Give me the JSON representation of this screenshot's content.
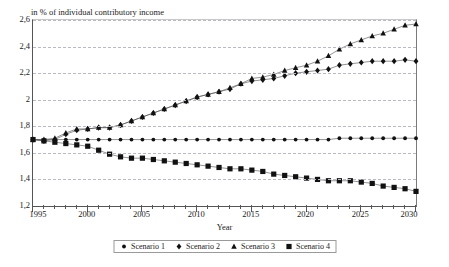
{
  "chart_data": {
    "type": "line",
    "title": "in % of individual contributory income",
    "xlabel": "Year",
    "ylabel": "",
    "xlim": [
      1995,
      2030
    ],
    "ylim": [
      1.2,
      2.6
    ],
    "ytick_step": 0.2,
    "xtick_step": 1,
    "xtick_label_step": 5,
    "grid": true,
    "decimal_separator": ",",
    "legend_position": "bottom",
    "ytick_labels": [
      "1,2",
      "1,4",
      "1,6",
      "1,8",
      "2",
      "2,2",
      "2,4",
      "2,6"
    ],
    "ytick_values": [
      1.2,
      1.4,
      1.6,
      1.8,
      2.0,
      2.2,
      2.4,
      2.6
    ],
    "xtick_labels": [
      "1995",
      "2000",
      "2005",
      "2010",
      "2015",
      "2020",
      "2025",
      "2030"
    ],
    "xtick_values": [
      1995,
      2000,
      2005,
      2010,
      2015,
      2020,
      2025,
      2030
    ],
    "x": [
      1995,
      1996,
      1997,
      1998,
      1999,
      2000,
      2001,
      2002,
      2003,
      2004,
      2005,
      2006,
      2007,
      2008,
      2009,
      2010,
      2011,
      2012,
      2013,
      2014,
      2015,
      2016,
      2017,
      2018,
      2019,
      2020,
      2021,
      2022,
      2023,
      2024,
      2025,
      2026,
      2027,
      2028,
      2029,
      2030
    ],
    "series": [
      {
        "name": "Scenario 1",
        "marker": "circle",
        "values": [
          1.7,
          1.7,
          1.7,
          1.7,
          1.7,
          1.7,
          1.7,
          1.7,
          1.7,
          1.7,
          1.7,
          1.7,
          1.7,
          1.7,
          1.7,
          1.7,
          1.7,
          1.7,
          1.7,
          1.7,
          1.7,
          1.7,
          1.7,
          1.7,
          1.7,
          1.7,
          1.7,
          1.7,
          1.71,
          1.71,
          1.71,
          1.71,
          1.71,
          1.71,
          1.71,
          1.71
        ]
      },
      {
        "name": "Scenario 2",
        "marker": "diamond",
        "values": [
          1.7,
          1.69,
          1.7,
          1.74,
          1.77,
          1.78,
          1.79,
          1.79,
          1.81,
          1.84,
          1.87,
          1.9,
          1.93,
          1.96,
          1.99,
          2.02,
          2.04,
          2.06,
          2.08,
          2.12,
          2.14,
          2.15,
          2.16,
          2.18,
          2.2,
          2.21,
          2.22,
          2.23,
          2.26,
          2.27,
          2.28,
          2.29,
          2.29,
          2.29,
          2.3,
          2.29
        ]
      },
      {
        "name": "Scenario 3",
        "marker": "triangle",
        "values": [
          1.7,
          1.7,
          1.71,
          1.75,
          1.78,
          1.78,
          1.79,
          1.79,
          1.81,
          1.84,
          1.87,
          1.9,
          1.93,
          1.96,
          1.99,
          2.02,
          2.04,
          2.06,
          2.09,
          2.12,
          2.16,
          2.17,
          2.19,
          2.22,
          2.24,
          2.26,
          2.29,
          2.33,
          2.38,
          2.42,
          2.45,
          2.48,
          2.5,
          2.53,
          2.56,
          2.57
        ]
      },
      {
        "name": "Scenario 4",
        "marker": "square",
        "values": [
          1.7,
          1.69,
          1.68,
          1.67,
          1.66,
          1.65,
          1.62,
          1.59,
          1.57,
          1.56,
          1.56,
          1.55,
          1.54,
          1.53,
          1.52,
          1.51,
          1.5,
          1.49,
          1.48,
          1.48,
          1.47,
          1.46,
          1.44,
          1.43,
          1.42,
          1.41,
          1.4,
          1.39,
          1.39,
          1.39,
          1.38,
          1.37,
          1.35,
          1.34,
          1.33,
          1.31
        ]
      }
    ]
  },
  "legend": {
    "items": [
      {
        "label": "Scenario 1"
      },
      {
        "label": "Scenario 2"
      },
      {
        "label": "Scenario 3"
      },
      {
        "label": "Scenario 4"
      }
    ]
  }
}
